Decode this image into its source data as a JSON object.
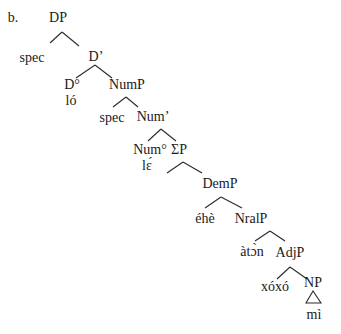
{
  "example_label": "b.",
  "nodes": {
    "dp": "DP",
    "dp_spec": "spec",
    "d_bar": "D’",
    "d_head": "D°",
    "d_word": "ló",
    "nump": "NumP",
    "nump_spec": "spec",
    "num_bar": "Num’",
    "num_head": "Num°",
    "num_word": "lɛ́",
    "sigmap": "ΣP",
    "demp": "DemP",
    "dem_word": "éhè",
    "nralp": "NralP",
    "nral_word": "àtɔ̀n",
    "adjp": "AdjP",
    "adj_word": "xóxó",
    "np": "NP",
    "np_word": "mì"
  },
  "edges": [
    [
      "dp",
      "dp_spec"
    ],
    [
      "dp",
      "d_bar"
    ],
    [
      "d_bar",
      "d_head"
    ],
    [
      "d_bar",
      "nump"
    ],
    [
      "nump",
      "nump_spec"
    ],
    [
      "nump",
      "num_bar"
    ],
    [
      "num_bar",
      "num_head"
    ],
    [
      "num_bar",
      "sigmap"
    ],
    [
      "sigmap",
      "empty_left"
    ],
    [
      "sigmap",
      "demp"
    ],
    [
      "demp",
      "dem_word"
    ],
    [
      "demp",
      "nralp"
    ],
    [
      "nralp",
      "nral_word"
    ],
    [
      "nralp",
      "adjp"
    ],
    [
      "adjp",
      "adj_word"
    ],
    [
      "adjp",
      "np"
    ]
  ],
  "triangle_under": "np"
}
